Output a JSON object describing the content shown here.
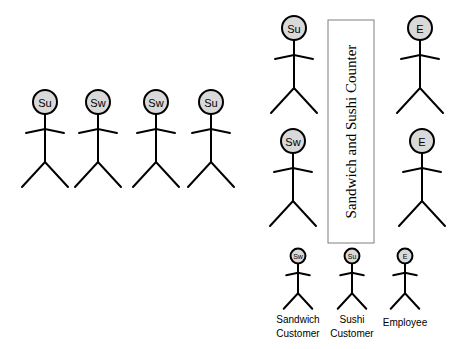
{
  "diagram": {
    "counter": {
      "label": "Sandwich and Sushi Counter",
      "x": 328,
      "y": 20,
      "w": 46,
      "h": 223
    },
    "queue": [
      {
        "label": "Su",
        "type": "sushi-customer",
        "cx": 45,
        "cy": 102
      },
      {
        "label": "Sw",
        "type": "sandwich-customer",
        "cx": 98,
        "cy": 102
      },
      {
        "label": "Sw",
        "type": "sandwich-customer",
        "cx": 156,
        "cy": 102
      },
      {
        "label": "Su",
        "type": "sushi-customer",
        "cx": 211,
        "cy": 102
      }
    ],
    "at_counter": [
      {
        "label": "Su",
        "type": "sushi-customer",
        "cx": 294,
        "cy": 28
      },
      {
        "label": "Sw",
        "type": "sandwich-customer",
        "cx": 293,
        "cy": 141
      }
    ],
    "employees": [
      {
        "label": "E",
        "type": "employee",
        "cx": 420,
        "cy": 28
      },
      {
        "label": "E",
        "type": "employee",
        "cx": 422,
        "cy": 141
      }
    ],
    "legend": [
      {
        "icon": "Sw",
        "line1": "Sandwich",
        "line2": "Customer",
        "cx": 298,
        "cy": 256
      },
      {
        "icon": "Su",
        "line1": "Sushi",
        "line2": "Customer",
        "cx": 352,
        "cy": 256
      },
      {
        "icon": "E",
        "line1": "Employee",
        "line2": "",
        "cx": 405,
        "cy": 256
      }
    ]
  }
}
